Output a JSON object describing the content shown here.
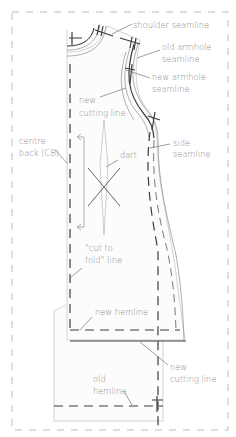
{
  "diagram": {
    "colors": {
      "line_dark": "#3c3c3c",
      "line_light": "#c8c8c8",
      "label_text": "#8a8a8a",
      "frame": "#bdbdbd"
    },
    "labels": {
      "shoulder_seamline": "shoulder seamline",
      "old_armhole_1": "old armhole",
      "old_armhole_2": "seamline",
      "new_armhole_1": "new armhole",
      "new_armhole_2": "seamline",
      "new_cutting_line_top_1": "new",
      "new_cutting_line_top_2": "cutting line",
      "centre_back_1": "centre",
      "centre_back_2": "back (CB)",
      "dart": "dart",
      "side_seamline_1": "side",
      "side_seamline_2": "seamline",
      "cut_to_fold_1": "\"cut to",
      "cut_to_fold_2": "fold\" line",
      "new_hemline": "new hemline",
      "new_cutting_line_bottom_1": "new",
      "new_cutting_line_bottom_2": "cutting line",
      "old_hemline_1": "old",
      "old_hemline_2": "hemline"
    }
  }
}
